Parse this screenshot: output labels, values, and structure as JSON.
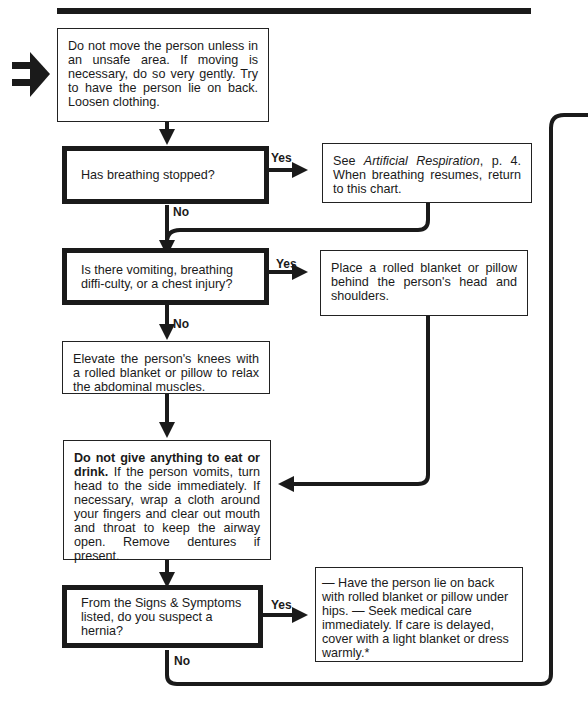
{
  "entry_arrow": "double-right-arrow",
  "nodes": {
    "start": "Do not move the person unless in an unsafe area. If moving is necessary, do so very gently. Try to have the person lie on back. Loosen clothing.",
    "q1": "Has breathing stopped?",
    "q1_yes_pre": "See ",
    "q1_yes_italic": "Artificial Respiration",
    "q1_yes_post": ", p. 4. When breathing resumes, return to this chart.",
    "q2": "Is there vomiting, breathing diffi-culty, or a chest injury?",
    "q2_yes": "Place a rolled blanket or pillow behind the person's head and shoulders.",
    "elevate": "Elevate the person's knees with a rolled blanket or pillow to relax the abdominal muscles.",
    "nofood_bold": "Do not give anything to eat or drink.",
    "nofood_rest": " If the person vomits, turn head to the side immediately. If necessary, wrap a cloth around your fingers and clear out mouth and throat to keep the airway open. Remove dentures if present.",
    "q3": "From the Signs & Symptoms listed, do you suspect a hernia?",
    "q3_yes": "— Have the person lie on back with rolled blanket or pillow under hips. — Seek medical care immediately. If care is delayed, cover with a light blanket or dress warmly.*"
  },
  "labels": {
    "yes": "Yes",
    "no": "No"
  }
}
